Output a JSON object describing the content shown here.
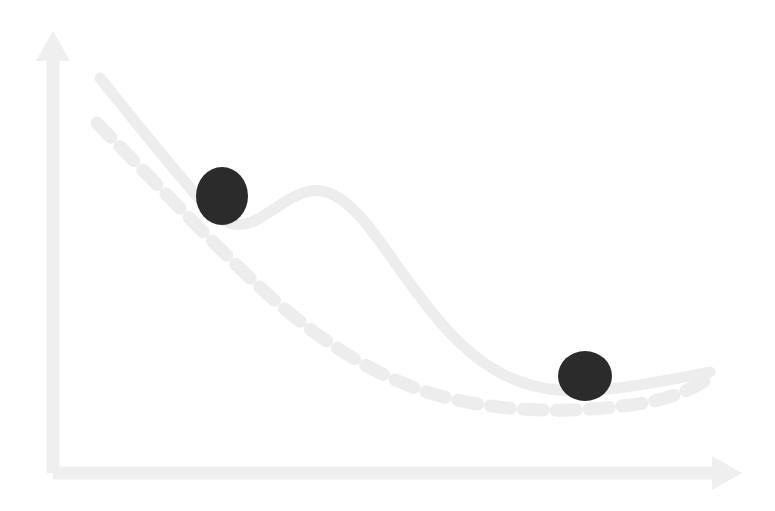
{
  "figure": {
    "title": "Optimization landscape with local and global minimum",
    "subtitle": "",
    "background_color": "#FFFFFF",
    "width": 775,
    "height": 511
  },
  "style": {
    "axis_color": "#EFEFEF",
    "curve_solid_color": "#EDEDED",
    "curve_dashed_color": "#EDEDED",
    "ball_color": "#2B2B2B",
    "axis_width": 13,
    "curve_solid_width": 11,
    "curve_dashed_width": 13,
    "dash_pattern": "20 13"
  },
  "axes": {
    "x_axis": {
      "name": "x-axis",
      "label": "",
      "start": [
        53,
        473
      ],
      "end": [
        720,
        473
      ],
      "arrow_tip": [
        742,
        473
      ],
      "arrow_half_height": 17,
      "arrow_length": 30
    },
    "y_axis": {
      "name": "y-axis",
      "label": "",
      "start": [
        53,
        473
      ],
      "end": [
        53,
        55
      ],
      "arrow_tip": [
        53,
        31
      ],
      "arrow_half_height": 17,
      "arrow_length": 30
    }
  },
  "chart_data": {
    "type": "line",
    "title": "Optimization landscape with local and global minimum",
    "xlabel": "",
    "ylabel": "",
    "grid": false,
    "legend": "none",
    "axis_ranges": {
      "x": [
        53,
        742
      ],
      "y": [
        31,
        473
      ]
    },
    "series": [
      {
        "name": "non-convex-loss-curve",
        "style": "solid",
        "color": "#EDEDED",
        "description": "Solid curve with a local minimum, a local maximum hump, then descending to the global minimum",
        "path": "M 100,78 C 140,128 182,180 206,206 C 222,224 238,228 252,222 C 272,213 288,196 310,191 C 336,186 360,213 386,250 C 420,298 452,344 492,368 C 524,388 560,394 600,390 C 648,385 684,377 710,372",
        "points": [
          [
            100,
            78
          ],
          [
            150,
            140
          ],
          [
            200,
            200
          ],
          [
            230,
            224
          ],
          [
            252,
            222
          ],
          [
            280,
            205
          ],
          [
            310,
            191
          ],
          [
            340,
            200
          ],
          [
            380,
            243
          ],
          [
            420,
            295
          ],
          [
            470,
            350
          ],
          [
            520,
            380
          ],
          [
            570,
            391
          ],
          [
            630,
            384
          ],
          [
            670,
            378
          ],
          [
            710,
            372
          ]
        ]
      },
      {
        "name": "convex-loss-curve",
        "style": "dashed",
        "color": "#EDEDED",
        "description": "Dashed smooth convex curve descending monotonically to the global minimum",
        "path": "M 97,123 C 148,175 200,230 252,280 C 310,334 372,378 444,397 C 512,414 580,413 644,403 C 678,397 698,386 712,376",
        "points": [
          [
            97,
            123
          ],
          [
            150,
            177
          ],
          [
            200,
            230
          ],
          [
            252,
            280
          ],
          [
            310,
            330
          ],
          [
            370,
            374
          ],
          [
            430,
            395
          ],
          [
            490,
            405
          ],
          [
            550,
            408
          ],
          [
            610,
            407
          ],
          [
            660,
            400
          ],
          [
            712,
            376
          ]
        ]
      }
    ],
    "annotations": [
      {
        "name": "local-minimum-ball",
        "label": "",
        "shape": "circle",
        "cx": 222,
        "cy": 196,
        "rx": 26,
        "ry": 29,
        "color": "#2B2B2B",
        "meaning": "optimizer trapped in local minimum"
      },
      {
        "name": "global-minimum-ball",
        "label": "",
        "shape": "circle",
        "cx": 585,
        "cy": 376,
        "rx": 27,
        "ry": 25,
        "color": "#2B2B2B",
        "meaning": "optimizer reaching global minimum"
      }
    ]
  }
}
